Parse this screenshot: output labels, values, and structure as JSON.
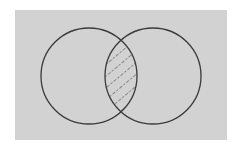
{
  "diagram": {
    "type": "venn",
    "background_color": "#d2d2d2",
    "stroke_color": "#3a3a3a",
    "sets": [
      {
        "name": "left-set",
        "cx": 89,
        "cy": 76,
        "r": 48
      },
      {
        "name": "right-set",
        "cx": 153,
        "cy": 76,
        "r": 48
      }
    ],
    "shaded_region": "intersection",
    "shading_style": "dashed-diagonal-hatch"
  }
}
